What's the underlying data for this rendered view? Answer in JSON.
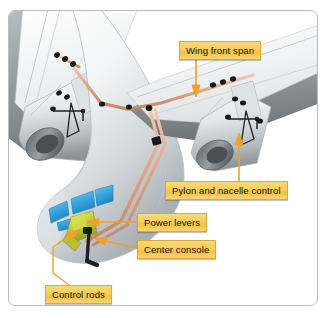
{
  "figure": {
    "background_color": "#ffffff",
    "border_color": "#b9bcbe"
  },
  "callouts": [
    {
      "id": "wing-front-span",
      "label": "Wing front span",
      "leader": "arrow-down",
      "target": "wing front spar / control rod run"
    },
    {
      "id": "pylon-nacelle-control",
      "label": "Pylon and nacelle control",
      "leader": "arrow-up",
      "target": "right engine pylon linkage"
    },
    {
      "id": "power-levers",
      "label": "Power levers",
      "leader": "arrow-left",
      "target": "cockpit power levers"
    },
    {
      "id": "center-console",
      "label": "Center console",
      "leader": "arrow-left",
      "target": "cockpit center console"
    },
    {
      "id": "control-rods",
      "label": "Control rods",
      "leader": "arrow-up-right",
      "target": "control rod run under cabin floor"
    }
  ],
  "label_style": {
    "fill_top": "#fbd976",
    "fill_mid": "#f2c243",
    "border": "#d9a93a",
    "text_color": "#141414"
  },
  "artwork": {
    "airframe_color": "#f2f3f4",
    "airframe_shadow": "#8e9295",
    "nacelle_color": "#e6e8ea",
    "control_rod_color": "#e0a98a",
    "joint_color": "#1b1b1b",
    "cockpit_window_color": "#3ea8e0",
    "power_lever_color": "#c8cc3a",
    "leader_color": "#f0a22a",
    "linkage_outline": "#2a2a2a"
  }
}
